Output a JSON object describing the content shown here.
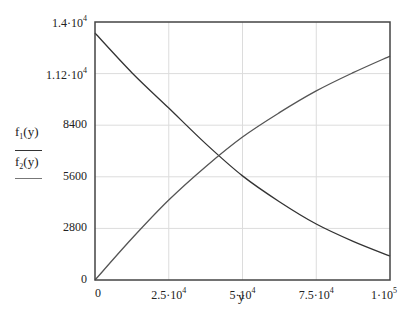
{
  "chart_data": {
    "type": "line",
    "title": "",
    "xlabel": "y",
    "ylabel": "",
    "xlim": [
      0,
      100000
    ],
    "ylim": [
      0,
      14000
    ],
    "grid": true,
    "legend_position": "left",
    "x_ticks": [
      {
        "value": 0,
        "mantissa": "0",
        "exp": ""
      },
      {
        "value": 25000,
        "mantissa": "2.5·10",
        "exp": "4"
      },
      {
        "value": 50000,
        "mantissa": "5·10",
        "exp": "4"
      },
      {
        "value": 75000,
        "mantissa": "7.5·10",
        "exp": "4"
      },
      {
        "value": 100000,
        "mantissa": "1·10",
        "exp": "5"
      }
    ],
    "y_ticks": [
      {
        "value": 0,
        "mantissa": "0",
        "exp": ""
      },
      {
        "value": 2800,
        "mantissa": "2800",
        "exp": ""
      },
      {
        "value": 5600,
        "mantissa": "5600",
        "exp": ""
      },
      {
        "value": 8400,
        "mantissa": "8400",
        "exp": ""
      },
      {
        "value": 11200,
        "mantissa": "1.12·10",
        "exp": "4"
      },
      {
        "value": 14000,
        "mantissa": "1.4·10",
        "exp": "4"
      }
    ],
    "x": [
      0,
      12500,
      25000,
      37500,
      50000,
      62500,
      75000,
      87500,
      100000
    ],
    "series": [
      {
        "name": "f1(y)",
        "label_base": "f",
        "label_sub": "1",
        "label_arg": "(y)",
        "color": "#333333",
        "values": [
          13400,
          11250,
          9330,
          7400,
          5650,
          4250,
          3040,
          2100,
          1300
        ]
      },
      {
        "name": "f2(y)",
        "label_base": "f",
        "label_sub": "2",
        "label_arg": "(y)",
        "color": "#555555",
        "values": [
          0,
          2250,
          4340,
          6150,
          7760,
          9080,
          10260,
          11250,
          12150
        ]
      }
    ]
  }
}
